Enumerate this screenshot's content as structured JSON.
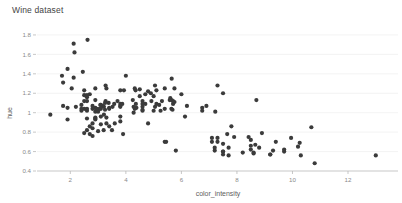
{
  "chart_data": {
    "type": "scatter",
    "title": "Wine dataset",
    "xlabel": "color_intensity",
    "ylabel": "hue",
    "xlim": [
      0.8,
      13.8
    ],
    "ylim": [
      0.4,
      1.82
    ],
    "grid": "horizontal",
    "legend": "none",
    "marker_color": "#3b3b3b",
    "marker_size": 2.1,
    "background_color": "#ffffff",
    "gridline_color": "#f0f0f0",
    "axis_color": "#b9b9b9",
    "xticks": [
      2,
      4,
      6,
      8,
      10,
      12
    ],
    "xtick_labels": [
      "2",
      "4",
      "6",
      "8",
      "10",
      "12"
    ],
    "yticks": [
      0.4,
      0.6,
      0.8,
      1.0,
      1.2,
      1.4,
      1.6,
      1.8
    ],
    "ytick_labels": [
      "0.4",
      "0.6",
      "0.8",
      "1",
      "1.2",
      "1.4",
      "1.6",
      "1.8"
    ],
    "x": [
      5.64,
      4.38,
      5.68,
      7.8,
      4.32,
      6.75,
      5.25,
      5.05,
      5.2,
      7.22,
      5.75,
      5.0,
      5.6,
      5.4,
      7.5,
      7.3,
      6.2,
      8.7,
      5.1,
      6.13,
      3.52,
      3.58,
      6.0,
      4.36,
      3.7,
      6.75,
      4.6,
      5.4,
      4.8,
      5.1,
      5.65,
      4.5,
      3.93,
      4.8,
      4.32,
      4.0,
      6.9,
      4.9,
      4.7,
      5.7,
      4.6,
      3.8,
      4.6,
      5.65,
      3.8,
      3.27,
      3.8,
      4.6,
      5.3,
      4.25,
      3.38,
      4.6,
      4.5,
      4.7,
      5.7,
      5.0,
      4.92,
      5.58,
      4.35,
      5.05,
      2.15,
      3.3,
      5.75,
      3.4,
      2.9,
      2.62,
      2.94,
      4.28,
      3.87,
      4.28,
      3.05,
      2.12,
      2.4,
      2.5,
      2.6,
      2.9,
      2.6,
      3.0,
      2.8,
      3.3,
      3.17,
      3.21,
      2.5,
      2.9,
      2.6,
      2.8,
      2.4,
      3.1,
      3.21,
      2.4,
      3.27,
      2.94,
      3.1,
      2.9,
      1.28,
      2.5,
      2.2,
      3.4,
      1.74,
      3.8,
      2.95,
      1.9,
      2.9,
      1.74,
      2.5,
      2.05,
      2.45,
      2.6,
      1.7,
      2.9,
      3.8,
      3.1,
      2.6,
      1.9,
      2.12,
      2.6,
      3.25,
      3.25,
      2.7,
      3.08,
      2.9,
      3.3,
      3.8,
      3.4,
      2.8,
      2.8,
      1.9,
      2.7,
      2.5,
      3.2,
      3.1,
      3.9,
      3.5,
      2.8,
      2.7,
      3.0,
      3.6,
      2.6,
      7.65,
      7.9,
      8.9,
      7.5,
      5.4,
      7.1,
      10.2,
      10.68,
      8.5,
      5.45,
      10.26,
      8.66,
      7.5,
      9.7,
      7.7,
      7.3,
      8.21,
      7.5,
      9.3,
      13.0,
      7.1,
      5.8,
      8.42,
      10.8,
      7.2,
      8.5,
      9.95,
      8.6,
      9.2,
      10.3,
      9.4,
      8.6,
      9.7,
      8.5,
      8.8,
      7.5,
      9.2,
      7.2,
      7.3,
      7.7
    ],
    "y": [
      1.04,
      1.05,
      1.03,
      0.86,
      1.04,
      1.05,
      1.02,
      1.06,
      1.08,
      1.01,
      1.25,
      1.17,
      1.15,
      1.25,
      1.2,
      1.28,
      1.07,
      1.13,
      1.23,
      0.96,
      1.06,
      1.09,
      1.19,
      1.09,
      1.12,
      1.02,
      1.06,
      1.04,
      0.89,
      1.09,
      1.35,
      1.24,
      1.23,
      1.22,
      1.25,
      1.38,
      1.07,
      1.2,
      1.09,
      1.12,
      1.02,
      1.09,
      1.12,
      1.13,
      1.23,
      1.28,
      1.07,
      1.03,
      1.12,
      1.13,
      1.1,
      1.09,
      1.17,
      1.19,
      1.09,
      1.02,
      1.12,
      1.13,
      1.23,
      1.28,
      1.62,
      1.25,
      1.11,
      1.05,
      1.01,
      1.75,
      1.04,
      1.0,
      1.09,
      1.06,
      1.04,
      1.71,
      1.02,
      1.04,
      0.94,
      1.05,
      1.18,
      1.01,
      1.04,
      0.95,
      1.07,
      0.98,
      1.18,
      1.25,
      1.04,
      1.07,
      1.08,
      0.96,
      1.06,
      1.04,
      1.12,
      1.02,
      1.08,
      0.93,
      0.98,
      1.12,
      1.06,
      1.04,
      1.07,
      0.96,
      1.04,
      1.05,
      0.94,
      1.31,
      1.23,
      1.25,
      1.42,
      1.12,
      1.38,
      1.13,
      1.06,
      1.04,
      1.02,
      1.45,
      1.36,
      1.16,
      1.1,
      1.03,
      1.19,
      1.08,
      0.95,
      0.89,
      0.91,
      0.86,
      0.84,
      0.89,
      0.93,
      0.78,
      0.79,
      0.82,
      0.88,
      0.78,
      0.82,
      0.76,
      0.86,
      0.81,
      0.89,
      0.82,
      0.78,
      0.75,
      0.79,
      0.68,
      0.7,
      0.74,
      0.65,
      0.85,
      0.72,
      0.7,
      0.69,
      0.67,
      0.57,
      0.62,
      0.64,
      0.7,
      0.59,
      0.6,
      0.61,
      0.56,
      0.7,
      0.61,
      0.75,
      0.48,
      0.61,
      0.66,
      0.74,
      0.58,
      0.57,
      0.56,
      0.7,
      0.59,
      0.6,
      0.62,
      0.64,
      0.6,
      0.57,
      0.64,
      0.74,
      0.56
    ]
  }
}
